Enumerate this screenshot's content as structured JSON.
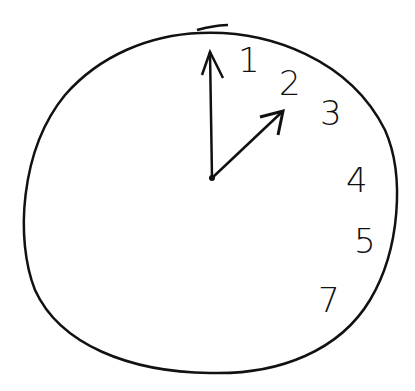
{
  "drawing": {
    "description": "Hand-drawn clock face",
    "stroke_color": "#111111",
    "background": "#ffffff",
    "numbers": [
      {
        "label": "1",
        "x": 238,
        "y": 72
      },
      {
        "label": "2",
        "x": 279,
        "y": 95
      },
      {
        "label": "3",
        "x": 320,
        "y": 125
      },
      {
        "label": "4",
        "x": 346,
        "y": 192
      },
      {
        "label": "5",
        "x": 354,
        "y": 253
      },
      {
        "label": "7",
        "x": 318,
        "y": 312
      }
    ],
    "hands": [
      {
        "name": "minute-hand",
        "from": [
          212,
          178
        ],
        "to": [
          210,
          52
        ]
      },
      {
        "name": "hour-hand",
        "from": [
          212,
          178
        ],
        "to": [
          283,
          111
        ]
      }
    ]
  }
}
